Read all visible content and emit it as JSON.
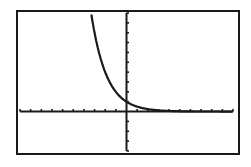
{
  "chart_data": {
    "type": "line",
    "title": "",
    "xlabel": "",
    "ylabel": "",
    "grid": false,
    "legend": "none",
    "xlim": [
      -10,
      10
    ],
    "ylim": [
      -4,
      10
    ],
    "x_ticks_step": 1,
    "y_ticks_step": 1,
    "series": [
      {
        "name": "y = (1/2)^x",
        "x": [
          -3.8,
          -3.5,
          -3,
          -2.5,
          -2,
          -1.5,
          -1,
          -0.5,
          0,
          0.5,
          1,
          1.5,
          2,
          3,
          4,
          5
        ],
        "values": [
          13.9,
          11.3,
          8,
          5.66,
          4,
          2.83,
          2,
          1.41,
          1,
          0.71,
          0.5,
          0.35,
          0.25,
          0.125,
          0.06,
          0.03
        ]
      }
    ]
  },
  "colors": {
    "ink": "#1a1a1a",
    "background": "#ffffff"
  }
}
